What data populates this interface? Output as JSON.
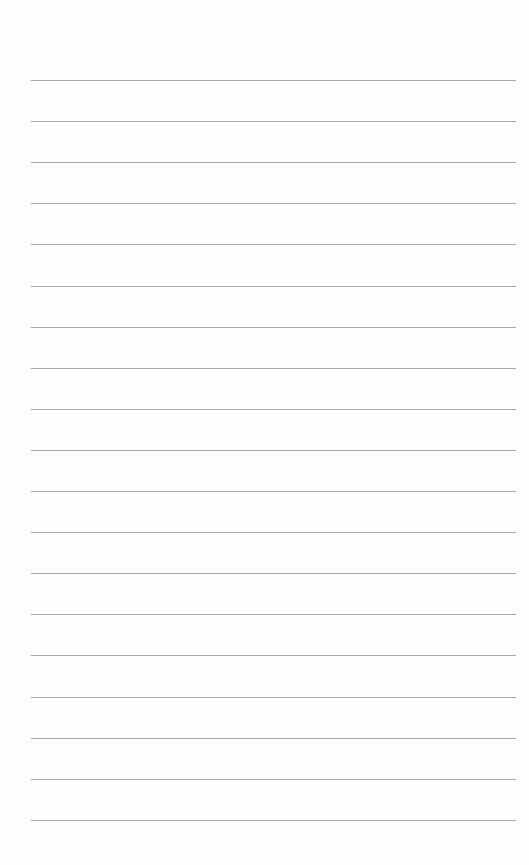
{
  "page": {
    "type": "lined-paper",
    "background_color": "#fefefe",
    "line_color": "#a8a8a8",
    "line_count": 19,
    "first_line_y": 80,
    "line_spacing": 41.1,
    "line_left": 31,
    "line_right": 516,
    "text": ""
  }
}
